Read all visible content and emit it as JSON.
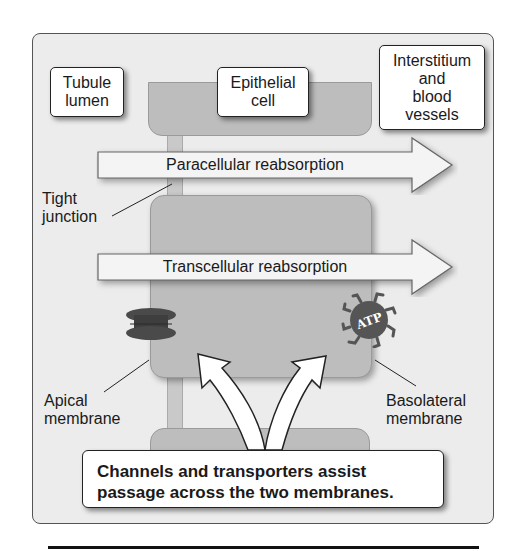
{
  "diagram": {
    "regions": {
      "tubule_lumen": "Tubule lumen",
      "epithelial_cell": "Epithelial cell",
      "interstitium": "Interstitium and blood vessels"
    },
    "region_lines": {
      "tubule_lumen": [
        "Tubule",
        "lumen"
      ],
      "epithelial_cell": [
        "Epithelial",
        "cell"
      ],
      "interstitium": [
        "Interstitium",
        "and",
        "blood",
        "vessels"
      ]
    },
    "arrows": {
      "paracellular": "Paracellular reabsorption",
      "transcellular": "Transcellular reabsorption"
    },
    "callouts": {
      "tight_junction": [
        "Tight",
        "junction"
      ],
      "apical_membrane": [
        "Apical",
        "membrane"
      ],
      "basolateral_membrane": [
        "Basolateral",
        "membrane"
      ]
    },
    "transporter_label": "ATP",
    "caption": [
      "Channels and transporters assist",
      "passage across the two membranes."
    ],
    "colors": {
      "panel": "#ececec",
      "cell": "#bdbdbd",
      "channel": "#4a4a4a",
      "atp_pump": "#5a5a5a",
      "arrow_fill": "#f4f4f4",
      "rule": "#111111"
    }
  }
}
